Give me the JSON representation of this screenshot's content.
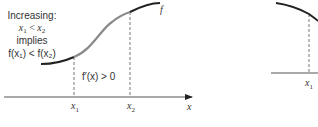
{
  "figure": {
    "left_panel": {
      "caption_lines": [
        "Increasing:",
        "x₁ < x₂",
        "implies",
        "f(x₁) < f(x₂)"
      ],
      "caption": {
        "line1": "Increasing:",
        "line2_a": "x",
        "line2_sub1": "1",
        "line2_op": " < ",
        "line2_b": "x",
        "line2_sub2": "2",
        "line3": "implies",
        "line4": "f(x₁) < f(x₂)"
      },
      "derivative_label": "f′(x) > 0",
      "function_label": "f",
      "axis_label": "x",
      "tick_x1": "x",
      "tick_x1_sub": "1",
      "tick_x2": "x",
      "tick_x2_sub": "2",
      "colors": {
        "curve": "#222222",
        "highlight_segment": "#8a8a8a",
        "axis": "#555555",
        "dashed": "#555555"
      }
    },
    "right_panel": {
      "tick_x1": "x",
      "tick_x1_sub": "1",
      "colors": {
        "curve": "#222222",
        "axis": "#555555"
      }
    }
  }
}
